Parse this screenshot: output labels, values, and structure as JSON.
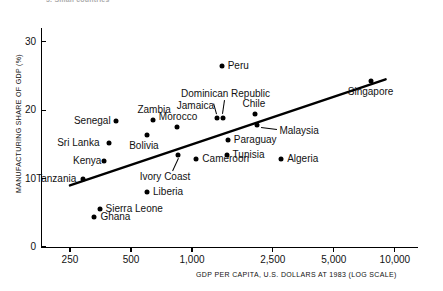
{
  "figure": {
    "caption_fragment": "3. Small countries",
    "background": "#ffffff",
    "ink_color": "#000000"
  },
  "chart_data": {
    "type": "scatter",
    "title": "",
    "xlabel": "GDP PER CAPITA, U.S. DOLLARS AT 1983 (LOG SCALE)",
    "ylabel": "MANUFACTURING SHARE OF GDP (%)",
    "xscale": "log",
    "xlim": [
      180,
      13000
    ],
    "ylim": [
      0,
      32
    ],
    "xticks": [
      250,
      500,
      1000,
      2500,
      5000,
      10000
    ],
    "xtick_labels": [
      "250",
      "500",
      "1,000",
      "2,500",
      "5,000",
      "10,000"
    ],
    "yticks": [
      0,
      10,
      20,
      30
    ],
    "ytick_labels": [
      "0",
      "10",
      "20",
      "30"
    ],
    "grid": false,
    "legend": false,
    "trendline": {
      "type": "linear-fit-on-log-x",
      "x_start": 250,
      "y_start": 9.0,
      "x_end": 9000,
      "y_end": 24.5
    },
    "points": [
      {
        "name": "Tanzania",
        "x": 290,
        "y": 10.0,
        "label_pos": "left"
      },
      {
        "name": "Kenya",
        "x": 370,
        "y": 12.6,
        "label_pos": "left"
      },
      {
        "name": "Sri Lanka",
        "x": 390,
        "y": 15.2,
        "label_pos": "left"
      },
      {
        "name": "Ghana",
        "x": 330,
        "y": 4.4,
        "label_pos": "right"
      },
      {
        "name": "Sierra Leone",
        "x": 350,
        "y": 5.6,
        "label_pos": "right"
      },
      {
        "name": "Senegal",
        "x": 420,
        "y": 18.4,
        "label_pos": "left"
      },
      {
        "name": "Bolivia",
        "x": 600,
        "y": 16.3,
        "label_pos": "below"
      },
      {
        "name": "Zambia",
        "x": 640,
        "y": 18.6,
        "label_pos": "above"
      },
      {
        "name": "Liberia",
        "x": 600,
        "y": 8.0,
        "label_pos": "right"
      },
      {
        "name": "Ivory Coast",
        "x": 850,
        "y": 13.4,
        "label_pos": "leader-below"
      },
      {
        "name": "Morocco",
        "x": 840,
        "y": 17.6,
        "label_pos": "above"
      },
      {
        "name": "Cameroon",
        "x": 1050,
        "y": 12.8,
        "label_pos": "right"
      },
      {
        "name": "Jamaica",
        "x": 1320,
        "y": 18.9,
        "label_pos": "leader-above"
      },
      {
        "name": "Dominican Republic",
        "x": 1420,
        "y": 18.9,
        "label_pos": "leader-above"
      },
      {
        "name": "Peru",
        "x": 1400,
        "y": 26.4,
        "label_pos": "right"
      },
      {
        "name": "Paraguay",
        "x": 1500,
        "y": 15.6,
        "label_pos": "right"
      },
      {
        "name": "Tunisia",
        "x": 1480,
        "y": 13.4,
        "label_pos": "right"
      },
      {
        "name": "Chile",
        "x": 2050,
        "y": 19.4,
        "label_pos": "above"
      },
      {
        "name": "Malaysia",
        "x": 2100,
        "y": 17.8,
        "label_pos": "leader-right"
      },
      {
        "name": "Algeria",
        "x": 2750,
        "y": 12.8,
        "label_pos": "right"
      },
      {
        "name": "Singapore",
        "x": 7600,
        "y": 24.3,
        "label_pos": "below"
      }
    ]
  }
}
